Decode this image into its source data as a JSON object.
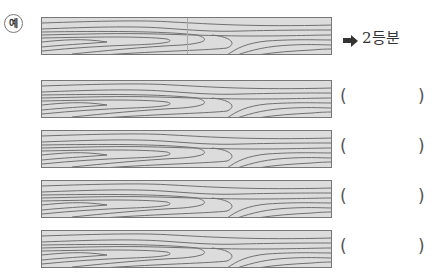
{
  "example": {
    "badge": "예",
    "answer": "2등분",
    "divisions": 2
  },
  "rows": [
    {
      "open": "(",
      "close": ")",
      "answer": ""
    },
    {
      "open": "(",
      "close": ")",
      "answer": ""
    },
    {
      "open": "(",
      "close": ")",
      "answer": ""
    },
    {
      "open": "(",
      "close": ")",
      "answer": ""
    }
  ]
}
